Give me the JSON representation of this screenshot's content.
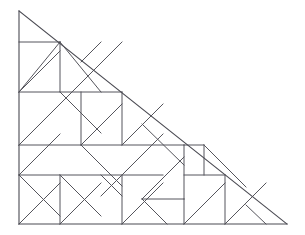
{
  "figure": {
    "canvas": {
      "width": 305,
      "height": 235
    },
    "background_color": "#ffffff",
    "line_color": "#55555c",
    "line_width": 1,
    "vertices": {
      "top_left": [
        19,
        11
      ],
      "bottom_left": [
        19,
        224
      ],
      "bottom_right": [
        287,
        224
      ]
    },
    "grid": {
      "x_positions": [
        19,
        60,
        81,
        101,
        122,
        142,
        163,
        184,
        204,
        225,
        246,
        266,
        287
      ],
      "y_positions": [
        11,
        42,
        62,
        92,
        118,
        145,
        160,
        175,
        199,
        224
      ]
    },
    "outline_segments": [
      {
        "name": "left-edge",
        "x1": 19,
        "y1": 11,
        "x2": 19,
        "y2": 224
      },
      {
        "name": "bottom-edge",
        "x1": 19,
        "y1": 224,
        "x2": 287,
        "y2": 224
      },
      {
        "name": "hypotenuse",
        "x1": 19,
        "y1": 11,
        "x2": 287,
        "y2": 224
      }
    ],
    "interior_segments": [
      {
        "name": "h-top-short",
        "x1": 19,
        "y1": 42,
        "x2": 60,
        "y2": 42
      },
      {
        "name": "h-upper-mid",
        "x1": 19,
        "y1": 92,
        "x2": 122,
        "y2": 92
      },
      {
        "name": "h-mid",
        "x1": 19,
        "y1": 145,
        "x2": 184,
        "y2": 145
      },
      {
        "name": "h-mid-right",
        "x1": 184,
        "y1": 145,
        "x2": 204,
        "y2": 145
      },
      {
        "name": "h-lower",
        "x1": 19,
        "y1": 175,
        "x2": 163,
        "y2": 175
      },
      {
        "name": "h-lower-right",
        "x1": 184,
        "y1": 175,
        "x2": 225,
        "y2": 175
      },
      {
        "name": "h-small-notch",
        "x1": 142,
        "y1": 199,
        "x2": 184,
        "y2": 199
      },
      {
        "name": "v-60-upper",
        "x1": 60,
        "y1": 42,
        "x2": 60,
        "y2": 92
      },
      {
        "name": "v-60-lower",
        "x1": 60,
        "y1": 175,
        "x2": 60,
        "y2": 224
      },
      {
        "name": "v-81",
        "x1": 81,
        "y1": 92,
        "x2": 81,
        "y2": 145
      },
      {
        "name": "v-122-upper",
        "x1": 122,
        "y1": 92,
        "x2": 122,
        "y2": 145
      },
      {
        "name": "v-122-lower",
        "x1": 122,
        "y1": 175,
        "x2": 122,
        "y2": 224
      },
      {
        "name": "v-184-mid",
        "x1": 184,
        "y1": 145,
        "x2": 184,
        "y2": 199
      },
      {
        "name": "v-184-lower",
        "x1": 184,
        "y1": 199,
        "x2": 184,
        "y2": 224
      },
      {
        "name": "v-204",
        "x1": 204,
        "y1": 145,
        "x2": 204,
        "y2": 175
      },
      {
        "name": "v-225",
        "x1": 225,
        "y1": 175,
        "x2": 225,
        "y2": 224
      },
      {
        "name": "d-nw-1",
        "x1": 19,
        "y1": 92,
        "x2": 60,
        "y2": 42
      },
      {
        "name": "d-nw-2",
        "x1": 19,
        "y1": 92,
        "x2": 60,
        "y2": 51
      },
      {
        "name": "d-nw-3",
        "x1": 60,
        "y1": 42,
        "x2": 101,
        "y2": 92
      },
      {
        "name": "d-nw-4",
        "x1": 81,
        "y1": 62,
        "x2": 101,
        "y2": 42
      },
      {
        "name": "d-nw-5",
        "x1": 19,
        "y1": 145,
        "x2": 122,
        "y2": 42
      },
      {
        "name": "d-nw-6",
        "x1": 60,
        "y1": 92,
        "x2": 101,
        "y2": 133
      },
      {
        "name": "d-mid-1",
        "x1": 19,
        "y1": 145,
        "x2": 60,
        "y2": 104
      },
      {
        "name": "d-mid-2",
        "x1": 19,
        "y1": 175,
        "x2": 60,
        "y2": 134
      },
      {
        "name": "d-mid-3",
        "x1": 19,
        "y1": 175,
        "x2": 60,
        "y2": 216
      },
      {
        "name": "d-mid-4",
        "x1": 19,
        "y1": 224,
        "x2": 60,
        "y2": 183
      },
      {
        "name": "d-mid-5",
        "x1": 60,
        "y1": 175,
        "x2": 101,
        "y2": 216
      },
      {
        "name": "d-mid-6",
        "x1": 60,
        "y1": 224,
        "x2": 101,
        "y2": 183
      },
      {
        "name": "d-mid-7",
        "x1": 81,
        "y1": 145,
        "x2": 122,
        "y2": 104
      },
      {
        "name": "d-mid-8",
        "x1": 81,
        "y1": 145,
        "x2": 122,
        "y2": 186
      },
      {
        "name": "d-mid-9",
        "x1": 101,
        "y1": 175,
        "x2": 122,
        "y2": 196
      },
      {
        "name": "d-mid-10",
        "x1": 101,
        "y1": 196,
        "x2": 122,
        "y2": 175
      },
      {
        "name": "d-mid-11",
        "x1": 122,
        "y1": 145,
        "x2": 163,
        "y2": 104
      },
      {
        "name": "d-mid-12",
        "x1": 122,
        "y1": 224,
        "x2": 163,
        "y2": 183
      },
      {
        "name": "d-mid-13",
        "x1": 122,
        "y1": 175,
        "x2": 163,
        "y2": 134
      },
      {
        "name": "d-right-1",
        "x1": 142,
        "y1": 124,
        "x2": 184,
        "y2": 165
      },
      {
        "name": "d-right-2",
        "x1": 142,
        "y1": 199,
        "x2": 184,
        "y2": 157
      },
      {
        "name": "d-right-3",
        "x1": 142,
        "y1": 199,
        "x2": 167,
        "y2": 224
      },
      {
        "name": "d-right-4",
        "x1": 184,
        "y1": 224,
        "x2": 225,
        "y2": 183
      },
      {
        "name": "d-right-5",
        "x1": 204,
        "y1": 145,
        "x2": 246,
        "y2": 187
      },
      {
        "name": "d-right-6",
        "x1": 225,
        "y1": 224,
        "x2": 266,
        "y2": 183
      },
      {
        "name": "d-right-7",
        "x1": 246,
        "y1": 205,
        "x2": 266,
        "y2": 224
      }
    ]
  }
}
